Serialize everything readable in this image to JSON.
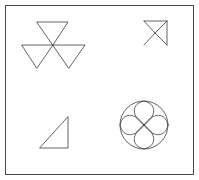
{
  "panel": {
    "title": "Geometric Figures Panel",
    "width": 199,
    "height": 180,
    "background_color": "#ffffff",
    "border_color": "#4a4a4a",
    "border_width": 1,
    "border_inset": 5,
    "stroke_color": "#3c3c3c",
    "stroke_width": 0.8
  },
  "figures": [
    {
      "id": "triangle-pinwheel",
      "name": "three-triangle-pinwheel",
      "label": "Three inverted triangles meeting at a common center point",
      "center": {
        "x": 53,
        "y": 45
      },
      "triangle_count": 3,
      "orientation": "pinwheel",
      "triangles": [
        {
          "name": "top-triangle",
          "points": "37,22 68,22 53,45"
        },
        {
          "name": "lower-left-triangle",
          "points": "22,45 53,45 37,68"
        },
        {
          "name": "lower-right-triangle",
          "points": "53,45 85,45 69,68"
        }
      ]
    },
    {
      "id": "bowtie-arrow",
      "name": "bowtie-with-vertical-edge",
      "label": "Bowtie of two triangles sharing an apex with a vertical right edge",
      "apex": {
        "x": 155,
        "y": 33
      },
      "segments": [
        {
          "name": "upper-left-to-apex",
          "points": "144,21 155,33"
        },
        {
          "name": "apex-to-lower-left",
          "points": "155,33 144,45"
        },
        {
          "name": "upper-left-to-top-right",
          "points": "144,21 167,21"
        },
        {
          "name": "top-right-to-apex",
          "points": "167,21 155,33"
        },
        {
          "name": "apex-to-bottom-right",
          "points": "155,33 167,45"
        },
        {
          "name": "vertical-right-edge",
          "points": "167,21 167,45"
        }
      ]
    },
    {
      "id": "right-triangle",
      "name": "right-angled-triangle",
      "label": "Right triangle with the right angle at the bottom-right corner",
      "points": "40,148 68,148 68,117",
      "right_angle_at": {
        "x": 68,
        "y": 148
      }
    },
    {
      "id": "rosette",
      "name": "four-petal-rosette-in-circle",
      "label": "Circle enclosing a four-petal flower of arcs",
      "circle": {
        "cx": 144,
        "cy": 125,
        "r": 24
      },
      "petal_count": 4,
      "petals": [
        {
          "name": "petal-up",
          "path": "M144,125 C131,116 131,104 144,101 C157,104 157,116 144,125 Z"
        },
        {
          "name": "petal-right",
          "path": "M144,125 C153,112 165,112 168,125 C165,138 153,138 144,125 Z"
        },
        {
          "name": "petal-down",
          "path": "M144,125 C157,134 157,146 144,149 C131,146 131,134 144,125 Z"
        },
        {
          "name": "petal-left",
          "path": "M144,125 C135,138 123,138 120,125 C123,112 135,112 144,125 Z"
        }
      ]
    }
  ]
}
